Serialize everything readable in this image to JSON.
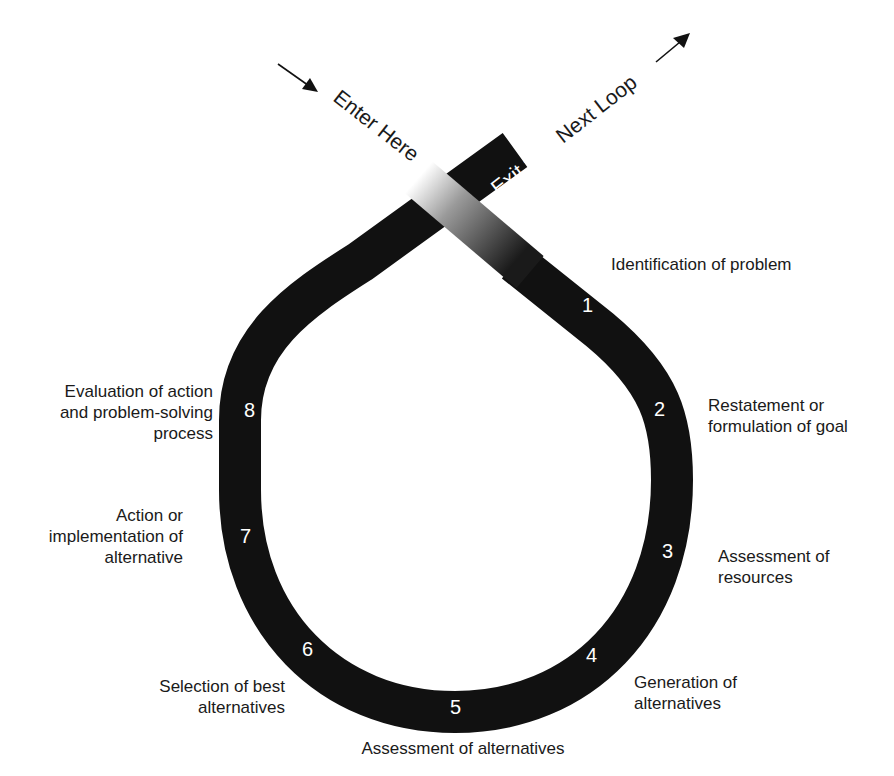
{
  "diagram": {
    "type": "problem-solving loop",
    "band_color": "#111111",
    "entry": {
      "label": "Enter Here"
    },
    "exit": {
      "label_part1": "Exit to",
      "label_part2": "Next Loop"
    },
    "steps": [
      {
        "number": "1",
        "label_lines": [
          "Identification of problem"
        ]
      },
      {
        "number": "2",
        "label_lines": [
          "Restatement or",
          "formulation of goal"
        ]
      },
      {
        "number": "3",
        "label_lines": [
          "Assessment of",
          "resources"
        ]
      },
      {
        "number": "4",
        "label_lines": [
          "Generation of",
          "alternatives"
        ]
      },
      {
        "number": "5",
        "label_lines": [
          "Assessment of alternatives"
        ]
      },
      {
        "number": "6",
        "label_lines": [
          "Selection of best",
          "alternatives"
        ]
      },
      {
        "number": "7",
        "label_lines": [
          "Action or",
          "implementation of",
          "alternative"
        ]
      },
      {
        "number": "8",
        "label_lines": [
          "Evaluation of action",
          "and problem-solving",
          "process"
        ]
      }
    ]
  }
}
